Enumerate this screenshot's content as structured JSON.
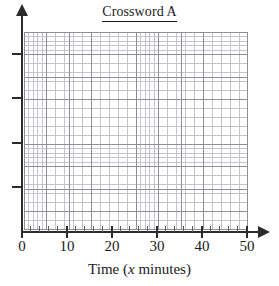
{
  "chart_data": {
    "type": "line",
    "title": "Crossword A",
    "title_underlined": true,
    "subtitle": "",
    "xlabel_parts": {
      "prefix": "Time (",
      "variable": "x",
      "suffix": " minutes)"
    },
    "xlabel": "Time (x minutes)",
    "ylabel": "",
    "series": [],
    "x": [],
    "values": [],
    "xlim": [
      0,
      50
    ],
    "ylim": [
      0,
      0
    ],
    "x_tick_labels": [
      "0",
      "10",
      "20",
      "30",
      "40",
      "50"
    ],
    "x_tick_values": [
      0,
      10,
      20,
      30,
      40,
      50
    ],
    "x_minor_tick_interval": 2,
    "y_tick_labels": [
      "",
      "",
      "",
      ""
    ],
    "y_tick_count": 4,
    "grid": true,
    "grid_minor": true,
    "grid_cells_x": 50,
    "grid_cells_y": 44,
    "grid_major_every": 5,
    "legend": null,
    "legend_position": "none",
    "annotations": [],
    "note": "Empty graph paper plot area with no plotted data"
  },
  "colors": {
    "background": "#ffffff",
    "axis": "#2b2b2b",
    "grid_major": "#8e8e96",
    "grid_minor": "#c3c3c9",
    "text": "#1a1a1a"
  },
  "axes": {
    "y_ticks": [
      {
        "name": "y-tick-1",
        "top": 53
      },
      {
        "name": "y-tick-2",
        "top": 97
      },
      {
        "name": "y-tick-3",
        "top": 142
      },
      {
        "name": "y-tick-4",
        "top": 186
      }
    ],
    "x_ticks": [
      {
        "label": "0",
        "left": 21
      },
      {
        "label": "10",
        "left": 66
      },
      {
        "label": "20",
        "left": 111
      },
      {
        "label": "30",
        "left": 156
      },
      {
        "label": "40",
        "left": 201
      },
      {
        "label": "50",
        "left": 246
      }
    ]
  }
}
